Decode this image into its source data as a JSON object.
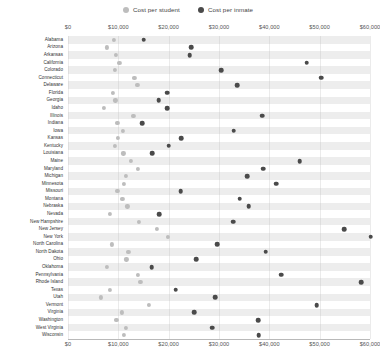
{
  "legend": {
    "items": [
      {
        "label": "Cost per student",
        "color": "#bdbdbd",
        "icon": "circle-marker-icon"
      },
      {
        "label": "Cost per inmate",
        "color": "#4a4a4a",
        "icon": "circle-marker-icon"
      }
    ]
  },
  "chart_data": {
    "type": "scatter",
    "title": "",
    "subtitle": "",
    "xlabel": "",
    "ylabel": "",
    "xlim": [
      0,
      60000
    ],
    "xticks": [
      0,
      10000,
      20000,
      30000,
      40000,
      50000,
      60000
    ],
    "xticklabels": [
      "$0",
      "$10,000",
      "$20,000",
      "$30,000",
      "$40,000",
      "$50,000",
      "$60,000"
    ],
    "grid": true,
    "legend_position": "top-center",
    "axis_positions": [
      "top",
      "bottom"
    ],
    "categories": [
      "Alabama",
      "Arizona",
      "Arkansas",
      "California",
      "Colorado",
      "Connecticut",
      "Delaware",
      "Florida",
      "Georgia",
      "Idaho",
      "Illinois",
      "Indiana",
      "Iowa",
      "Kansas",
      "Kentucky",
      "Louisiana",
      "Maine",
      "Maryland",
      "Michigan",
      "Minnesota",
      "Missouri",
      "Montana",
      "Nebraska",
      "Nevada",
      "New Hampshire",
      "New Jersey",
      "New York",
      "North Carolina",
      "North Dakota",
      "Ohio",
      "Oklahoma",
      "Pennsylvania",
      "Rhode Island",
      "Texas",
      "Utah",
      "Vermont",
      "Virginia",
      "Washington",
      "West Virginia",
      "Wisconsin"
    ],
    "series": [
      {
        "name": "Cost per student",
        "color": "#bdbdbd",
        "values": [
          9100,
          7700,
          9500,
          10200,
          9300,
          13200,
          13800,
          8900,
          9400,
          7100,
          13000,
          9800,
          10900,
          9900,
          9300,
          11000,
          12500,
          13900,
          11500,
          11100,
          9800,
          10800,
          11800,
          8300,
          14100,
          17600,
          19800,
          8700,
          12000,
          11600,
          7700,
          13900,
          14400,
          8300,
          6500,
          16000,
          10700,
          9600,
          11500,
          11100
        ]
      },
      {
        "name": "Cost per inmate",
        "color": "#4a4a4a",
        "values": [
          15000,
          24500,
          24200,
          47400,
          30400,
          50300,
          33600,
          19700,
          18000,
          19700,
          38600,
          14800,
          32900,
          22500,
          20000,
          16700,
          46000,
          38800,
          35600,
          41400,
          22400,
          34100,
          35900,
          18100,
          32800,
          54900,
          60100,
          29600,
          39300,
          25500,
          16600,
          42300,
          58300,
          21400,
          29200,
          49400,
          25100,
          37800,
          28600,
          37900
        ]
      }
    ]
  }
}
